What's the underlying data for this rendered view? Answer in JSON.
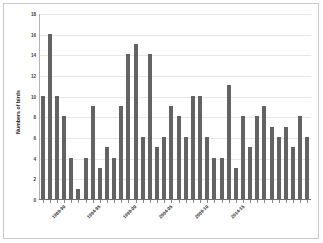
{
  "chart_data": {
    "type": "bar",
    "title": "",
    "xlabel": "",
    "ylabel": "Numbers of birds",
    "ylim": [
      0,
      18
    ],
    "ytick_values": [
      0,
      2,
      4,
      6,
      8,
      10,
      12,
      14,
      16,
      18
    ],
    "ytick_labels": [
      "0",
      "2",
      "4",
      "6",
      "8",
      "10",
      "12",
      "14",
      "16",
      "18"
    ],
    "grid": true,
    "legend": "none",
    "bar_color": "#636363",
    "categories": [
      "1989-90",
      "1990-91",
      "1991-92",
      "1992-93",
      "1993-94",
      "1994-95",
      "1995-96",
      "1996-97",
      "1997-98",
      "1998-99",
      "1999-00",
      "2000-01",
      "2001-02",
      "2002-03",
      "2003-04",
      "2004-05",
      "2005-06",
      "2006-07",
      "2007-08",
      "2008-09",
      "2009-10",
      "2010-11",
      "2011-12",
      "2012-13",
      "2013-14",
      "2014-15",
      "2015-16",
      "2016-17",
      "2017-18",
      "2018-19",
      "2019-20",
      "2020-21",
      "2021-22",
      "2022-23",
      "2023-24",
      "2024-25",
      "2025-26",
      "2026-27"
    ],
    "values": [
      10,
      16,
      10,
      8,
      4,
      1,
      4,
      9,
      3,
      5,
      4,
      9,
      14,
      15,
      6,
      14,
      5,
      6,
      9,
      8,
      6,
      10,
      10,
      6,
      4,
      4,
      11,
      3,
      8,
      5,
      8,
      9,
      7,
      6,
      7,
      5,
      8,
      6
    ],
    "labeled_tick_indices": [
      0,
      5,
      10,
      15,
      20,
      25
    ],
    "labeled_tick_text": [
      "1989-90",
      "1994-95",
      "1999-00",
      "2004-05",
      "2009-10",
      "2014-15"
    ]
  }
}
